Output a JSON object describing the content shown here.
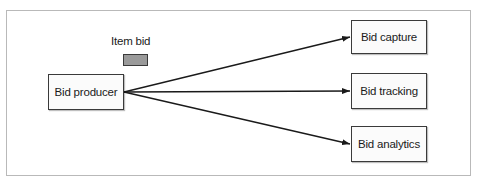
{
  "diagram": {
    "producer": {
      "label": "Bid producer"
    },
    "message": {
      "label": "Item bid",
      "color": "#9a9a9a"
    },
    "consumers": [
      {
        "label": "Bid capture"
      },
      {
        "label": "Bid tracking"
      },
      {
        "label": "Bid analytics"
      }
    ],
    "edges": [
      {
        "from": "Bid producer",
        "to": "Bid capture"
      },
      {
        "from": "Bid producer",
        "to": "Bid tracking"
      },
      {
        "from": "Bid producer",
        "to": "Bid analytics"
      }
    ]
  }
}
